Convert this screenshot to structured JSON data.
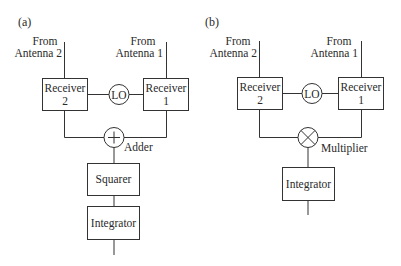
{
  "panels": {
    "a": {
      "label": "(a)",
      "antenna2": {
        "line1": "From",
        "line2": "Antenna 2"
      },
      "antenna1": {
        "line1": "From",
        "line2": "Antenna  1"
      },
      "receiver2": {
        "line1": "Receiver",
        "line2": "2"
      },
      "receiver1": {
        "line1": "Receiver",
        "line2": "1"
      },
      "lo": "LO",
      "combiner_symbol": "+",
      "combiner_label": "Adder",
      "blocks": [
        "Squarer",
        "Integrator"
      ]
    },
    "b": {
      "label": "(b)",
      "antenna2": {
        "line1": "From",
        "line2": "Antenna  2"
      },
      "antenna1": {
        "line1": "From",
        "line2": "Antenna  1"
      },
      "receiver2": {
        "line1": "Receiver",
        "line2": "2"
      },
      "receiver1": {
        "line1": "Receiver",
        "line2": "1"
      },
      "lo": "LO",
      "combiner_symbol": "×",
      "combiner_label": "Multiplier",
      "blocks": [
        "Integrator"
      ]
    }
  },
  "colors": {
    "stroke": "#333333",
    "text": "#2a2a2a",
    "background": "#ffffff"
  }
}
